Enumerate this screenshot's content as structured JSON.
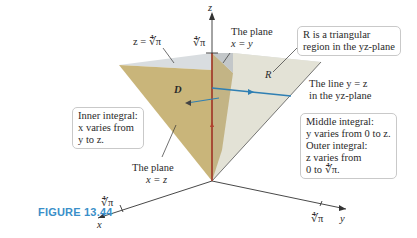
{
  "figure": {
    "caption": "FIGURE 13.44",
    "colors": {
      "caption": "#3a8fc9",
      "region_D_face": "#c9b57a",
      "top_face": "#d9dde0",
      "region_R_face": "#e3e2d6",
      "z_axis_segment": "#b0412e",
      "arrow_blue": "#2f7fb3",
      "axis": "#333333"
    },
    "axes": {
      "x": "x",
      "y": "y",
      "z": "z",
      "x_tick": "∜π",
      "y_tick": "∜π",
      "z_tick": "∜π"
    },
    "labels": {
      "z_plane": "z = ∜π",
      "plane_xy_line1": "The plane",
      "plane_xy_line2": "x = y",
      "plane_xz_line1": "The plane",
      "plane_xz_line2": "x = z",
      "line_yz_line1": "The line y = z",
      "line_yz_line2": "in the yz-plane",
      "region_D": "D",
      "region_R": "R"
    },
    "boxes": {
      "region_R": [
        "R is a triangular",
        "region in the yz-plane"
      ],
      "inner": [
        "Inner integral:",
        "x varies from",
        "y to z."
      ],
      "middle_outer": [
        "Middle integral:",
        "y varies from 0 to z.",
        "Outer integral:",
        "z varies from",
        "0 to ∜π."
      ]
    }
  }
}
